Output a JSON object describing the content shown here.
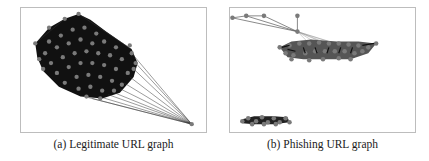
{
  "figure": {
    "panels": [
      {
        "id": "a",
        "caption": "(a) Legitimate URL graph",
        "description": "Dense single cluster of nodes with heavy edge mesh and one outlier node connected to many cluster nodes"
      },
      {
        "id": "b",
        "caption": "(b) Phishing URL graph",
        "description": "Two disconnected components: an elongated dense cluster upper-right with a hub connected to four peripheral nodes, and a small flat cluster lower-left"
      }
    ],
    "colors": {
      "node": "#7a7a7a",
      "edge": "#1a1a1a",
      "light_edge": "#ffffff",
      "frame": "#bdbdbd"
    }
  }
}
